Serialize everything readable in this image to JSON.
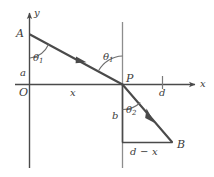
{
  "figure": {
    "type": "refraction-geometry-diagram",
    "stroke_color": "#4a4a4a",
    "text_color": "#3b3b3b",
    "background_color": "#ffffff",
    "axes": {
      "y_axis_label": "y",
      "x_axis_label": "x",
      "origin_label": "O"
    },
    "points": [
      {
        "id": "A",
        "label": "A"
      },
      {
        "id": "P",
        "label": "P"
      },
      {
        "id": "B",
        "label": "B"
      }
    ],
    "segments": [
      {
        "id": "vertical-distance-a",
        "label": "a"
      },
      {
        "id": "horizontal-distance-x",
        "label": "x"
      },
      {
        "id": "vertical-distance-b",
        "label": "b"
      },
      {
        "id": "horizontal-distance-d-minus-x",
        "label": "d − x"
      },
      {
        "id": "tick-distance-d",
        "label": "d"
      }
    ],
    "angles": [
      {
        "id": "theta1-at-A",
        "symbol": "θ",
        "subscript": "1"
      },
      {
        "id": "theta1-at-P",
        "symbol": "θ",
        "subscript": "1"
      },
      {
        "id": "theta2-at-P",
        "symbol": "θ",
        "subscript": "2"
      }
    ]
  }
}
